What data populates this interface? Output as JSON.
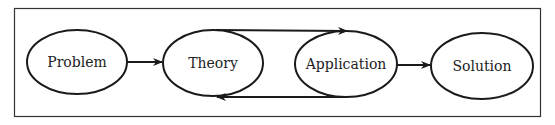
{
  "diagram": {
    "nodes": [
      {
        "id": "problem",
        "label": "Problem"
      },
      {
        "id": "theory",
        "label": "Theory"
      },
      {
        "id": "application",
        "label": "Application"
      },
      {
        "id": "solution",
        "label": "Solution"
      }
    ],
    "edges": [
      {
        "from": "Problem",
        "to": "Theory"
      },
      {
        "from": "Theory",
        "to": "Application"
      },
      {
        "from": "Application",
        "to": "Theory"
      },
      {
        "from": "Application",
        "to": "Solution"
      }
    ],
    "colors": {
      "stroke": "#1a1a1a",
      "background": "#ffffff"
    }
  }
}
